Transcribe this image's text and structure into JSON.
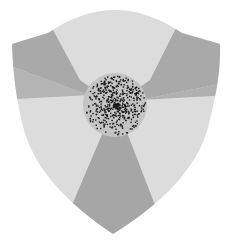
{
  "emblem": {
    "shape": "shield",
    "sectors": 3,
    "colors": {
      "background": "#ffffff",
      "light_sector": "#dcdcdc",
      "band": "#a8a8a8",
      "band_edge": "#9a9a9a",
      "center_disc": "#c4c4c4",
      "stipple": "#1a1a1a"
    },
    "center": {
      "x": 115,
      "y": 105,
      "radius": 32
    },
    "icon": "radiation-trefoil-shield-icon"
  }
}
